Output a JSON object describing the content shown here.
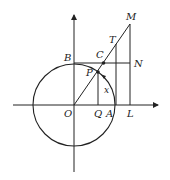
{
  "diagram": {
    "type": "unit-circle trigonometry figure",
    "labels": {
      "M": "M",
      "T": "T",
      "B": "B",
      "C": "C",
      "N": "N",
      "P": "P",
      "x": "x",
      "O": "O",
      "Q": "Q",
      "A": "A",
      "L": "L"
    },
    "colors": {
      "stroke": "#222222",
      "background": "#ffffff"
    }
  }
}
